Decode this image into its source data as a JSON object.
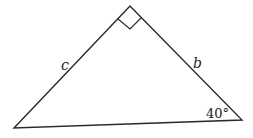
{
  "diagram": {
    "type": "right-triangle",
    "stroke_color": "#2a2a2a",
    "vertices": {
      "apex": {
        "x": 130,
        "y": 6,
        "note": "right angle"
      },
      "bottom_left": {
        "x": 14,
        "y": 128
      },
      "bottom_right": {
        "x": 242,
        "y": 120
      }
    },
    "right_angle_marker": {
      "points": [
        [
          130,
          6
        ],
        [
          118,
          19
        ],
        [
          130,
          29
        ],
        [
          141,
          18
        ]
      ]
    },
    "labels": {
      "side_c": "c",
      "side_b": "b",
      "angle": "40°"
    }
  }
}
